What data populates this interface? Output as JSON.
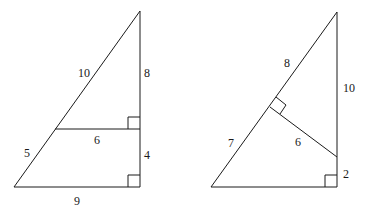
{
  "figures": [
    {
      "name": "left-triangle",
      "labels": {
        "upper_hypotenuse": "10",
        "upper_vertical": "8",
        "inner_horizontal": "6",
        "lower_hypotenuse": "5",
        "lower_vertical": "4",
        "base": "9"
      }
    },
    {
      "name": "right-triangle",
      "labels": {
        "upper_hypotenuse": "8",
        "vertical": "10",
        "lower_hypotenuse": "7",
        "perpendicular": "6",
        "lower_vertical": "2"
      }
    }
  ]
}
